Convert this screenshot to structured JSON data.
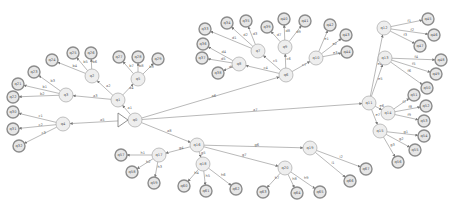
{
  "graph": {
    "title": "",
    "start_node": "q0",
    "nodes": [
      {
        "id": "q0",
        "x": 135,
        "y": 120,
        "leaf": false,
        "label": "q0"
      },
      {
        "id": "q1",
        "x": 118,
        "y": 100,
        "leaf": false,
        "label": "q1"
      },
      {
        "id": "q2",
        "x": 92,
        "y": 76,
        "leaf": false,
        "label": "q2"
      },
      {
        "id": "q3",
        "x": 66,
        "y": 95,
        "leaf": false,
        "label": "q3"
      },
      {
        "id": "q4",
        "x": 63,
        "y": 124,
        "leaf": false,
        "label": "q4"
      },
      {
        "id": "q5",
        "x": 138,
        "y": 79,
        "leaf": false,
        "label": "q5"
      },
      {
        "id": "q6",
        "x": 286,
        "y": 75,
        "leaf": false,
        "label": "q6"
      },
      {
        "id": "q7",
        "x": 258,
        "y": 51,
        "leaf": false,
        "label": "q7"
      },
      {
        "id": "q8",
        "x": 239,
        "y": 64,
        "leaf": false,
        "label": "q8"
      },
      {
        "id": "q9",
        "x": 285,
        "y": 47,
        "leaf": false,
        "label": "q9"
      },
      {
        "id": "q10",
        "x": 316,
        "y": 58,
        "leaf": false,
        "label": "q10"
      },
      {
        "id": "q11",
        "x": 369,
        "y": 103,
        "leaf": false,
        "label": "q11"
      },
      {
        "id": "q12",
        "x": 384,
        "y": 28,
        "leaf": false,
        "label": "q12"
      },
      {
        "id": "q13",
        "x": 385,
        "y": 58,
        "leaf": false,
        "label": "q13"
      },
      {
        "id": "q14",
        "x": 388,
        "y": 113,
        "leaf": false,
        "label": "q14"
      },
      {
        "id": "q15",
        "x": 380,
        "y": 131,
        "leaf": false,
        "label": "q15"
      },
      {
        "id": "q16",
        "x": 197,
        "y": 145,
        "leaf": false,
        "label": "q16"
      },
      {
        "id": "q17",
        "x": 159,
        "y": 155,
        "leaf": false,
        "label": "q17"
      },
      {
        "id": "q18",
        "x": 203,
        "y": 164,
        "leaf": false,
        "label": "q18"
      },
      {
        "id": "q19",
        "x": 310,
        "y": 148,
        "leaf": false,
        "label": "q19"
      },
      {
        "id": "q20",
        "x": 285,
        "y": 168,
        "leaf": false,
        "label": "q20"
      },
      {
        "id": "a1",
        "x": 18,
        "y": 84,
        "leaf": true,
        "label": "q21"
      },
      {
        "id": "a2",
        "x": 13,
        "y": 97,
        "leaf": true,
        "label": "q22"
      },
      {
        "id": "a3",
        "x": 34,
        "y": 72,
        "leaf": true,
        "label": "q23"
      },
      {
        "id": "a4",
        "x": 52,
        "y": 60,
        "leaf": true,
        "label": "q24"
      },
      {
        "id": "a5",
        "x": 73,
        "y": 53,
        "leaf": true,
        "label": "q25"
      },
      {
        "id": "a6",
        "x": 91,
        "y": 53,
        "leaf": true,
        "label": "q26"
      },
      {
        "id": "a7",
        "x": 119,
        "y": 57,
        "leaf": true,
        "label": "q27"
      },
      {
        "id": "a8",
        "x": 138,
        "y": 57,
        "leaf": true,
        "label": "q28"
      },
      {
        "id": "a9",
        "x": 158,
        "y": 59,
        "leaf": true,
        "label": "q29"
      },
      {
        "id": "a10",
        "x": 13,
        "y": 112,
        "leaf": true,
        "label": "q30"
      },
      {
        "id": "a11",
        "x": 13,
        "y": 129,
        "leaf": true,
        "label": "q31"
      },
      {
        "id": "a12",
        "x": 19,
        "y": 146,
        "leaf": true,
        "label": "q32"
      },
      {
        "id": "b1",
        "x": 205,
        "y": 29,
        "leaf": true,
        "label": "q33"
      },
      {
        "id": "b2",
        "x": 227,
        "y": 23,
        "leaf": true,
        "label": "q34"
      },
      {
        "id": "b3",
        "x": 246,
        "y": 21,
        "leaf": true,
        "label": "q35"
      },
      {
        "id": "b4",
        "x": 203,
        "y": 44,
        "leaf": true,
        "label": "q36"
      },
      {
        "id": "b5",
        "x": 202,
        "y": 58,
        "leaf": true,
        "label": "q37"
      },
      {
        "id": "b6",
        "x": 218,
        "y": 73,
        "leaf": true,
        "label": "q38"
      },
      {
        "id": "b7",
        "x": 267,
        "y": 27,
        "leaf": true,
        "label": "q39"
      },
      {
        "id": "b8",
        "x": 284,
        "y": 19,
        "leaf": true,
        "label": "q40"
      },
      {
        "id": "b9",
        "x": 305,
        "y": 21,
        "leaf": true,
        "label": "q41"
      },
      {
        "id": "b10",
        "x": 330,
        "y": 25,
        "leaf": true,
        "label": "q42"
      },
      {
        "id": "b11",
        "x": 346,
        "y": 35,
        "leaf": true,
        "label": "q43"
      },
      {
        "id": "b12",
        "x": 347,
        "y": 52,
        "leaf": true,
        "label": "q44"
      },
      {
        "id": "c1",
        "x": 428,
        "y": 19,
        "leaf": true,
        "label": "q45"
      },
      {
        "id": "c2",
        "x": 434,
        "y": 35,
        "leaf": true,
        "label": "q46"
      },
      {
        "id": "c3",
        "x": 420,
        "y": 46,
        "leaf": true,
        "label": "q47"
      },
      {
        "id": "c4",
        "x": 441,
        "y": 60,
        "leaf": true,
        "label": "q48"
      },
      {
        "id": "c5",
        "x": 436,
        "y": 74,
        "leaf": true,
        "label": "q49"
      },
      {
        "id": "c6",
        "x": 427,
        "y": 88,
        "leaf": true,
        "label": "q50"
      },
      {
        "id": "c7",
        "x": 414,
        "y": 95,
        "leaf": true,
        "label": "q51"
      },
      {
        "id": "c8",
        "x": 426,
        "y": 106,
        "leaf": true,
        "label": "q52"
      },
      {
        "id": "c9",
        "x": 424,
        "y": 121,
        "leaf": true,
        "label": "q53"
      },
      {
        "id": "c10",
        "x": 424,
        "y": 136,
        "leaf": true,
        "label": "q54"
      },
      {
        "id": "c11",
        "x": 415,
        "y": 150,
        "leaf": true,
        "label": "q55"
      },
      {
        "id": "c12",
        "x": 398,
        "y": 162,
        "leaf": true,
        "label": "q56"
      },
      {
        "id": "d1",
        "x": 121,
        "y": 155,
        "leaf": true,
        "label": "q57"
      },
      {
        "id": "d2",
        "x": 132,
        "y": 172,
        "leaf": true,
        "label": "q58"
      },
      {
        "id": "d3",
        "x": 154,
        "y": 183,
        "leaf": true,
        "label": "q59"
      },
      {
        "id": "d4",
        "x": 184,
        "y": 186,
        "leaf": true,
        "label": "q60"
      },
      {
        "id": "d5",
        "x": 206,
        "y": 191,
        "leaf": true,
        "label": "q61"
      },
      {
        "id": "d6",
        "x": 236,
        "y": 189,
        "leaf": true,
        "label": "q62"
      },
      {
        "id": "d7",
        "x": 263,
        "y": 192,
        "leaf": true,
        "label": "q63"
      },
      {
        "id": "d8",
        "x": 297,
        "y": 193,
        "leaf": true,
        "label": "q64"
      },
      {
        "id": "d9",
        "x": 320,
        "y": 192,
        "leaf": true,
        "label": "q65"
      },
      {
        "id": "d10",
        "x": 350,
        "y": 181,
        "leaf": true,
        "label": "q66"
      },
      {
        "id": "d11",
        "x": 366,
        "y": 169,
        "leaf": true,
        "label": "q67"
      }
    ],
    "edges": [
      {
        "from": "q0",
        "to": "q1",
        "label": "a1"
      },
      {
        "from": "q1",
        "to": "q2",
        "label": "a2"
      },
      {
        "from": "q1",
        "to": "q3",
        "label": "a3"
      },
      {
        "from": "q1",
        "to": "q5",
        "label": "a4"
      },
      {
        "from": "q0",
        "to": "q4",
        "label": "a5"
      },
      {
        "from": "q0",
        "to": "q6",
        "label": "a6"
      },
      {
        "from": "q0",
        "to": "q11",
        "label": "a7"
      },
      {
        "from": "q0",
        "to": "q16",
        "label": "a8"
      },
      {
        "from": "q3",
        "to": "a1",
        "label": "b1"
      },
      {
        "from": "q3",
        "to": "a2",
        "label": "b2"
      },
      {
        "from": "q3",
        "to": "a3",
        "label": "b3"
      },
      {
        "from": "q2",
        "to": "a4",
        "label": "b4"
      },
      {
        "from": "q2",
        "to": "a5",
        "label": "b5"
      },
      {
        "from": "q2",
        "to": "a6",
        "label": "b6"
      },
      {
        "from": "q5",
        "to": "a7",
        "label": "b7"
      },
      {
        "from": "q5",
        "to": "a8",
        "label": "b8"
      },
      {
        "from": "q5",
        "to": "a9",
        "label": "b9"
      },
      {
        "from": "q4",
        "to": "a10",
        "label": "c1"
      },
      {
        "from": "q4",
        "to": "a11",
        "label": "c2"
      },
      {
        "from": "q4",
        "to": "a12",
        "label": "c3"
      },
      {
        "from": "q6",
        "to": "q8",
        "label": "c4"
      },
      {
        "from": "q6",
        "to": "q7",
        "label": "c5"
      },
      {
        "from": "q6",
        "to": "q9",
        "label": "c6"
      },
      {
        "from": "q6",
        "to": "q10",
        "label": "c7"
      },
      {
        "from": "q7",
        "to": "b1",
        "label": "d1"
      },
      {
        "from": "q7",
        "to": "b2",
        "label": "d2"
      },
      {
        "from": "q7",
        "to": "b3",
        "label": "d3"
      },
      {
        "from": "q8",
        "to": "b4",
        "label": "d4"
      },
      {
        "from": "q8",
        "to": "b5",
        "label": "d5"
      },
      {
        "from": "q8",
        "to": "b6",
        "label": "d6"
      },
      {
        "from": "q9",
        "to": "b7",
        "label": "d7"
      },
      {
        "from": "q9",
        "to": "b8",
        "label": "d8"
      },
      {
        "from": "q9",
        "to": "b9",
        "label": "d9"
      },
      {
        "from": "q10",
        "to": "b10",
        "label": "e1"
      },
      {
        "from": "q10",
        "to": "b11",
        "label": "e2"
      },
      {
        "from": "q10",
        "to": "b12",
        "label": "e3"
      },
      {
        "from": "q11",
        "to": "q12",
        "label": "e4"
      },
      {
        "from": "q11",
        "to": "q13",
        "label": "e5"
      },
      {
        "from": "q11",
        "to": "q14",
        "label": "e6"
      },
      {
        "from": "q11",
        "to": "q15",
        "label": "e7"
      },
      {
        "from": "q12",
        "to": "c1",
        "label": "f1"
      },
      {
        "from": "q12",
        "to": "c2",
        "label": "f2"
      },
      {
        "from": "q12",
        "to": "c3",
        "label": "f3"
      },
      {
        "from": "q13",
        "to": "c4",
        "label": "f4"
      },
      {
        "from": "q13",
        "to": "c5",
        "label": "f5"
      },
      {
        "from": "q13",
        "to": "c6",
        "label": "f6"
      },
      {
        "from": "q14",
        "to": "c7",
        "label": "f7"
      },
      {
        "from": "q14",
        "to": "c8",
        "label": "f8"
      },
      {
        "from": "q14",
        "to": "c9",
        "label": "f9"
      },
      {
        "from": "q15",
        "to": "c10",
        "label": "g1"
      },
      {
        "from": "q15",
        "to": "c11",
        "label": "g2"
      },
      {
        "from": "q15",
        "to": "c12",
        "label": "g3"
      },
      {
        "from": "q16",
        "to": "q17",
        "label": "g4"
      },
      {
        "from": "q16",
        "to": "q18",
        "label": "g5"
      },
      {
        "from": "q16",
        "to": "q19",
        "label": "g6"
      },
      {
        "from": "q16",
        "to": "q20",
        "label": "g7"
      },
      {
        "from": "q17",
        "to": "d1",
        "label": "h1"
      },
      {
        "from": "q17",
        "to": "d2",
        "label": "h2"
      },
      {
        "from": "q17",
        "to": "d3",
        "label": "h3"
      },
      {
        "from": "q18",
        "to": "d4",
        "label": "h4"
      },
      {
        "from": "q18",
        "to": "d5",
        "label": "h5"
      },
      {
        "from": "q18",
        "to": "d6",
        "label": "h6"
      },
      {
        "from": "q20",
        "to": "d7",
        "label": "h7"
      },
      {
        "from": "q20",
        "to": "d8",
        "label": "h8"
      },
      {
        "from": "q20",
        "to": "d9",
        "label": "h9"
      },
      {
        "from": "q19",
        "to": "d10",
        "label": "i1"
      },
      {
        "from": "q19",
        "to": "d11",
        "label": "i2"
      }
    ]
  }
}
